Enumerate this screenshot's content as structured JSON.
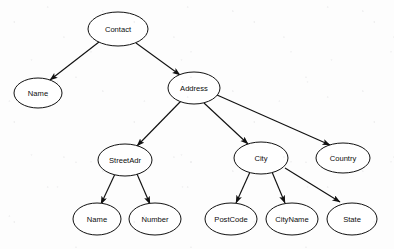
{
  "diagram": {
    "type": "tree",
    "background_color": "#fdfdfd",
    "node_fill": "#ffffff",
    "node_stroke": "#111111",
    "edge_color": "#111111",
    "nodes": [
      {
        "id": "contact",
        "label": "Contact",
        "cx": 118,
        "cy": 29,
        "rx": 30,
        "ry": 17
      },
      {
        "id": "name1",
        "label": "Name",
        "cx": 38,
        "cy": 93,
        "rx": 24,
        "ry": 15
      },
      {
        "id": "address",
        "label": "Address",
        "cx": 194,
        "cy": 88,
        "rx": 26,
        "ry": 16
      },
      {
        "id": "streetadr",
        "label": "StreetAdr",
        "cx": 125,
        "cy": 160,
        "rx": 27,
        "ry": 16
      },
      {
        "id": "city",
        "label": "City",
        "cx": 261,
        "cy": 158,
        "rx": 27,
        "ry": 16
      },
      {
        "id": "country",
        "label": "Country",
        "cx": 343,
        "cy": 158,
        "rx": 27,
        "ry": 15
      },
      {
        "id": "name2",
        "label": "Name",
        "cx": 97,
        "cy": 219,
        "rx": 24,
        "ry": 16
      },
      {
        "id": "number",
        "label": "Number",
        "cx": 155,
        "cy": 219,
        "rx": 26,
        "ry": 16
      },
      {
        "id": "postcode",
        "label": "PostCode",
        "cx": 231,
        "cy": 219,
        "rx": 26,
        "ry": 16
      },
      {
        "id": "cityname",
        "label": "CityName",
        "cx": 292,
        "cy": 219,
        "rx": 26,
        "ry": 16
      },
      {
        "id": "state",
        "label": "State",
        "cx": 352,
        "cy": 219,
        "rx": 25,
        "ry": 16
      }
    ],
    "edges": [
      {
        "id": "contact-name1",
        "from": "Contact",
        "to": "Name",
        "x1": 99,
        "y1": 42,
        "x2": 50,
        "y2": 80
      },
      {
        "id": "contact-address",
        "from": "Contact",
        "to": "Address",
        "x1": 136,
        "y1": 43,
        "x2": 180,
        "y2": 75
      },
      {
        "id": "address-street",
        "from": "Address",
        "to": "StreetAdr",
        "x1": 181,
        "y1": 101,
        "x2": 137,
        "y2": 146
      },
      {
        "id": "address-city",
        "from": "Address",
        "to": "City",
        "x1": 204,
        "y1": 103,
        "x2": 248,
        "y2": 144
      },
      {
        "id": "address-country",
        "from": "Address",
        "to": "Country",
        "x1": 217,
        "y1": 95,
        "x2": 330,
        "y2": 145
      },
      {
        "id": "street-name2",
        "from": "StreetAdr",
        "to": "Name",
        "x1": 115,
        "y1": 174,
        "x2": 101,
        "y2": 204
      },
      {
        "id": "street-number",
        "from": "StreetAdr",
        "to": "Number",
        "x1": 137,
        "y1": 174,
        "x2": 150,
        "y2": 204
      },
      {
        "id": "city-postcode",
        "from": "City",
        "to": "PostCode",
        "x1": 250,
        "y1": 172,
        "x2": 236,
        "y2": 203
      },
      {
        "id": "city-cityname",
        "from": "City",
        "to": "CityName",
        "x1": 272,
        "y1": 172,
        "x2": 285,
        "y2": 203
      },
      {
        "id": "city-state",
        "from": "City",
        "to": "State",
        "x1": 285,
        "y1": 168,
        "x2": 340,
        "y2": 202
      }
    ]
  }
}
